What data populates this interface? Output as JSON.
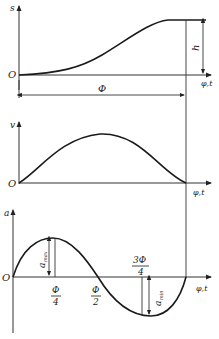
{
  "diagram": {
    "panels": [
      {
        "name": "displacement",
        "y_label": "s",
        "x_label": "φ,t",
        "origin_label": "O",
        "dimension_labels": {
          "rise": "h",
          "period": "Φ"
        }
      },
      {
        "name": "velocity",
        "y_label": "v",
        "x_label": "φ,t",
        "origin_label": "O"
      },
      {
        "name": "acceleration",
        "y_label": "a",
        "x_label": "φ,t",
        "origin_label": "O",
        "tick_labels": {
          "quarter_num": "Φ",
          "quarter_den": "4",
          "half_num": "Φ",
          "half_den": "2",
          "three_quarter_num": "3Φ",
          "three_quarter_den": "4"
        },
        "annotations": {
          "max_base": "a",
          "max_sub": "max",
          "min_base": "a",
          "min_sub": "min"
        }
      }
    ]
  },
  "colors": {
    "line": "#1a1a1a",
    "background": "#ffffff"
  }
}
